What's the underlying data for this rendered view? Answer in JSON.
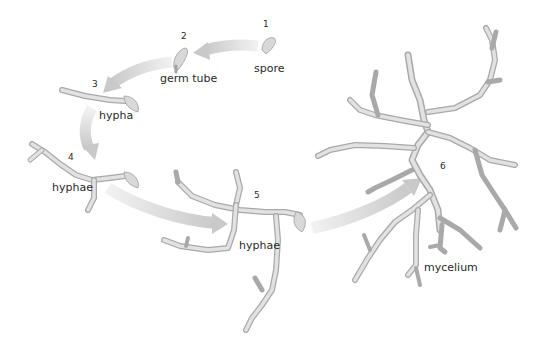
{
  "diagram": {
    "colors": {
      "background": "#ffffff",
      "hypha_fill": "#e0e0e0",
      "hypha_outline": "#a9a9a9",
      "arrow": "#d0d0d0",
      "text": "#2a2a2a"
    },
    "stages": [
      {
        "number": "1",
        "label": "spore"
      },
      {
        "number": "2",
        "label": "germ tube"
      },
      {
        "number": "3",
        "label": "hypha"
      },
      {
        "number": "4",
        "label": "hyphae"
      },
      {
        "number": "5",
        "label": "hyphae"
      },
      {
        "number": "6",
        "label": "mycelium"
      }
    ],
    "arrows": [
      {
        "from": "1",
        "to": "2"
      },
      {
        "from": "2",
        "to": "3"
      },
      {
        "from": "3",
        "to": "4"
      },
      {
        "from": "4",
        "to": "5"
      },
      {
        "from": "5",
        "to": "6"
      }
    ]
  }
}
